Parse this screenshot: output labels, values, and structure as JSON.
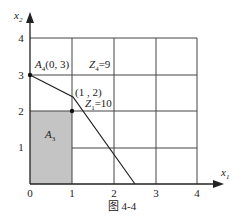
{
  "figure": {
    "caption": "图 4-4",
    "x_axis_label": "x",
    "x_axis_sub": "1",
    "y_axis_label": "x",
    "y_axis_sub": "2",
    "x_ticks": [
      "0",
      "1",
      "2",
      "3",
      "4"
    ],
    "y_ticks": [
      "1",
      "2",
      "3",
      "4"
    ],
    "point_A4": {
      "label": "A",
      "sub": "4",
      "coords": "(0, 3)"
    },
    "point_12": {
      "label": "(1 , 2)"
    },
    "z1": {
      "label": "Z",
      "sub": "1",
      "value": "=10"
    },
    "z4": {
      "label": "Z",
      "sub": "4",
      "value": "=9"
    },
    "region_A3": {
      "label": "A",
      "sub": "3"
    }
  },
  "colors": {
    "shade": "#c4c4c4",
    "line": "#333333"
  }
}
